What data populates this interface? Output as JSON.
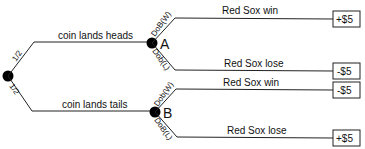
{
  "diagram": {
    "root": {
      "branch_top_prob": "1/2",
      "branch_bottom_prob": "1/2"
    },
    "branches": [
      {
        "label": "coin lands heads",
        "node": "A",
        "win_prob": "DoB(W)",
        "lose_prob": "Dob(L)",
        "win_label": "Red Sox win",
        "lose_label": "Red Sox lose",
        "win_payoff": "+$5",
        "lose_payoff": "-$5"
      },
      {
        "label": "coin lands tails",
        "node": "B",
        "win_prob": "Dob(W)",
        "lose_prob": "DoB(L)",
        "win_label": "Red Sox win",
        "lose_label": "Red Sox lose",
        "win_payoff": "-$5",
        "lose_payoff": "+$5"
      }
    ],
    "colors": {
      "line": "#222222",
      "node": "#000000"
    }
  }
}
